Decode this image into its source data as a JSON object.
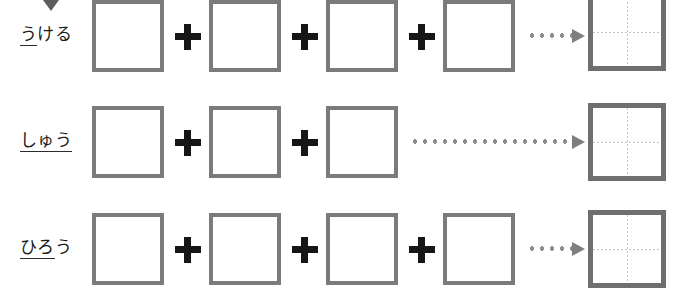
{
  "worksheet": {
    "title": "kanji component composition worksheet",
    "background_color": "#ffffff",
    "box_border_color": "#7b7b7b",
    "grid_border_color": "#6f6f6f",
    "plus_color": "#161616",
    "arrow_color": "#8d8d8d",
    "guide_line_color": "#c3c3c3",
    "marker": {
      "icon": "caret-down-icon",
      "color": "#5d5d5d"
    },
    "plus_symbol": "+",
    "rows": [
      {
        "reading": "うける",
        "reading_underlined_part": "う",
        "reading_trailing_part": "ける",
        "component_count": 4,
        "plus_count": 3,
        "arrow": "dotted-arrow-short",
        "result": "empty-kanji-grid"
      },
      {
        "reading": "しゅう",
        "reading_underlined_part": "しゅう",
        "reading_trailing_part": "",
        "component_count": 3,
        "plus_count": 2,
        "arrow": "dotted-arrow-long",
        "result": "empty-kanji-grid"
      },
      {
        "reading": "ひろう",
        "reading_underlined_part": "ひろ",
        "reading_trailing_part": "う",
        "component_count": 4,
        "plus_count": 3,
        "arrow": "dotted-arrow-short",
        "result": "empty-kanji-grid"
      }
    ]
  }
}
